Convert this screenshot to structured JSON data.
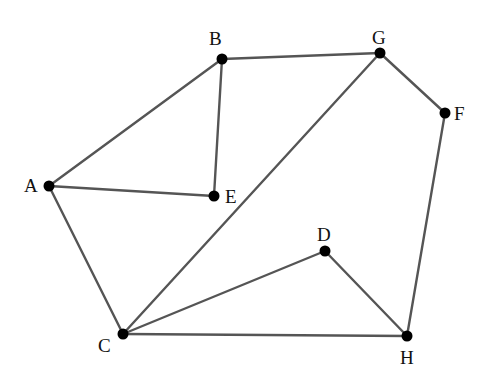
{
  "graph": {
    "colors": {
      "edge": "#555555",
      "node": "#000000",
      "label": "#111111",
      "background": "#ffffff"
    },
    "nodes": [
      {
        "id": "A",
        "label": "A",
        "x": 49,
        "y": 186,
        "lx": 24,
        "ly": 192
      },
      {
        "id": "B",
        "label": "B",
        "x": 222,
        "y": 59,
        "lx": 209,
        "ly": 45
      },
      {
        "id": "C",
        "label": "C",
        "x": 123,
        "y": 334,
        "lx": 98,
        "ly": 352
      },
      {
        "id": "D",
        "label": "D",
        "x": 325,
        "y": 251,
        "lx": 317,
        "ly": 241
      },
      {
        "id": "E",
        "label": "E",
        "x": 214,
        "y": 196,
        "lx": 225,
        "ly": 203
      },
      {
        "id": "F",
        "label": "F",
        "x": 445,
        "y": 113,
        "lx": 454,
        "ly": 120
      },
      {
        "id": "G",
        "label": "G",
        "x": 380,
        "y": 53,
        "lx": 372,
        "ly": 44
      },
      {
        "id": "H",
        "label": "H",
        "x": 407,
        "y": 336,
        "lx": 400,
        "ly": 364
      }
    ],
    "edges": [
      [
        "A",
        "B"
      ],
      [
        "A",
        "E"
      ],
      [
        "A",
        "C"
      ],
      [
        "B",
        "E"
      ],
      [
        "B",
        "G"
      ],
      [
        "G",
        "F"
      ],
      [
        "G",
        "C"
      ],
      [
        "F",
        "H"
      ],
      [
        "C",
        "D"
      ],
      [
        "C",
        "H"
      ],
      [
        "D",
        "H"
      ]
    ]
  }
}
